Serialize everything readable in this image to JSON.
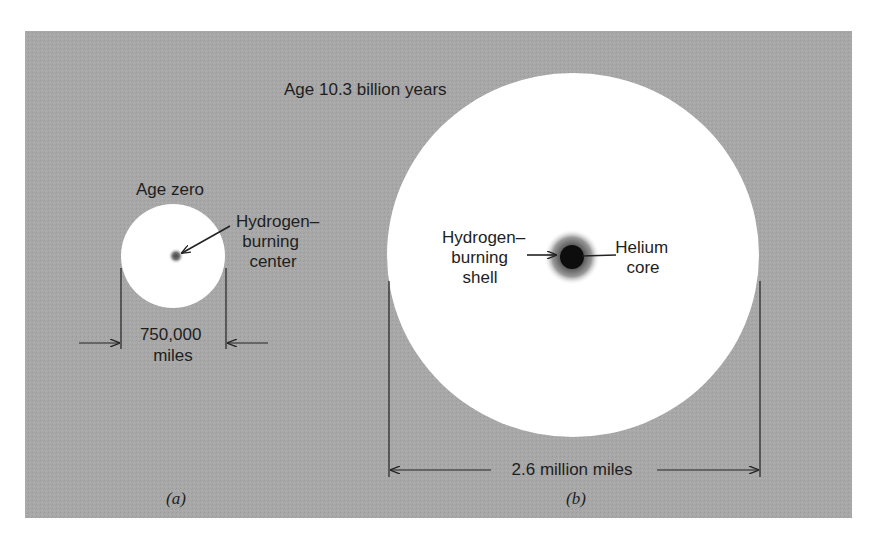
{
  "figure": {
    "background_color": "#a9a9a9",
    "star_fill": "#ffffff",
    "core_color": "#0d0d0d",
    "line_color": "#222222"
  },
  "panel_a": {
    "title": "Age zero",
    "label_lines": [
      "Hydrogen–",
      "burning",
      "center"
    ],
    "dimension_lines": [
      "750,000",
      "miles"
    ],
    "caption": "(a)"
  },
  "panel_b": {
    "title": "Age 10.3 billion years",
    "shell_label_lines": [
      "Hydrogen–",
      "burning",
      "shell"
    ],
    "core_label_lines": [
      "Helium",
      "core"
    ],
    "dimension_label": "2.6 million miles",
    "caption": "(b)"
  }
}
